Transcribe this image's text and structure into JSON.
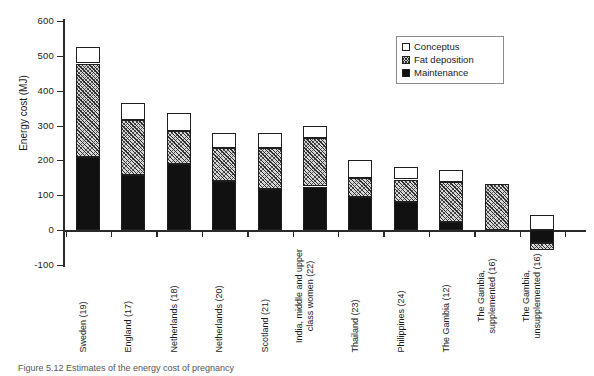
{
  "figure": {
    "caption": "Figure 5.12   Estimates of the energy cost of pregnancy"
  },
  "axes": {
    "y_title": "Energy cost (MJ)",
    "y_ticks": [
      600,
      500,
      400,
      300,
      200,
      100,
      0,
      -100
    ],
    "y_tick_labels": [
      "600",
      "500",
      "400",
      "300",
      "200",
      "100",
      "0",
      "-100"
    ],
    "x_title": ""
  },
  "legend": {
    "position": "top-right",
    "items": [
      {
        "label": "Conceptus",
        "swatch": "white-square-icon",
        "color": "#ffffff"
      },
      {
        "label": "Fat deposition",
        "swatch": "hatched-square-icon",
        "color": "#cfcfcf"
      },
      {
        "label": "Maintenance",
        "swatch": "black-square-icon",
        "color": "#111111"
      }
    ]
  },
  "chart_data": {
    "type": "bar",
    "stacked": true,
    "title": "",
    "xlabel": "",
    "ylabel": "Energy cost (MJ)",
    "ylim": [
      -100,
      600
    ],
    "ytick_step": 100,
    "grid": false,
    "legend_position": "top-right",
    "categories": [
      "Sweden (19)",
      "England (17)",
      "Netherlands (18)",
      "Netherlands (20)",
      "Scotland (21)",
      "India, middle and upper\nclass women (22)",
      "Thailand (23)",
      "Philippines (24)",
      "The Gambia (12)",
      "The Gambia,\nsupplemented (16)",
      "The Gambia,\nunsupplemented (16)"
    ],
    "series": [
      {
        "name": "Maintenance",
        "color": "#111111",
        "values": [
          210,
          157,
          190,
          140,
          118,
          125,
          95,
          80,
          23,
          0,
          -38
        ]
      },
      {
        "name": "Fat deposition",
        "color": "#cfcfcf",
        "values": [
          268,
          158,
          95,
          95,
          117,
          140,
          55,
          65,
          115,
          133,
          -19
        ]
      },
      {
        "name": "Conceptus",
        "color": "#ffffff",
        "values": [
          47,
          50,
          50,
          45,
          43,
          35,
          50,
          35,
          34,
          0,
          43
        ]
      }
    ],
    "totals": [
      525,
      365,
      335,
      280,
      278,
      300,
      200,
      180,
      172,
      133,
      -14
    ]
  }
}
